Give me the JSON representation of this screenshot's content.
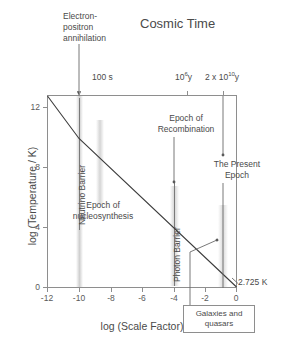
{
  "chart_data": {
    "type": "line",
    "title": "Cosmic Time",
    "xlabel": "log (Scale Factor)",
    "ylabel": "log (Temperature / K)",
    "xlim": [
      -13,
      1
    ],
    "ylim": [
      0,
      12.8
    ],
    "grid": false,
    "legend": "none",
    "x_ticks": [
      "-12",
      "-10",
      "-8",
      "-6",
      "-4",
      "-2",
      "0"
    ],
    "x_tick_values": [
      -12,
      -10,
      -8,
      -6,
      -4,
      -2,
      0
    ],
    "y_ticks": [
      "12",
      "8",
      "4",
      "0"
    ],
    "y_tick_values": [
      12,
      8,
      4,
      0
    ],
    "top_axis_label": "Cosmic Time",
    "top_ticks": [
      {
        "label": "100 s",
        "x": -10.2,
        "sup": ""
      },
      {
        "label": "10",
        "sup": "6",
        "suffix": " y",
        "x": -3.1
      },
      {
        "label": "2 x 10",
        "sup": "10",
        "suffix": " y",
        "x": -0.7
      }
    ],
    "series": [
      {
        "name": "Temperature of the Universe",
        "x": [
          -12.8,
          -10.2,
          0.2
        ],
        "values": [
          12.6,
          9.9,
          0.435
        ],
        "note": "Radiation-dominated then matter-dominated cooling curve; terminates at 2.725 K"
      }
    ],
    "annotations": [
      {
        "name": "electron-positron-annihilation",
        "text": "Electron-positron annihilation",
        "x": -10.2,
        "arrow": "down"
      },
      {
        "name": "neutrino-barrier",
        "text": "Neutrino Barrier",
        "x": -10.1,
        "orientation": "vertical"
      },
      {
        "name": "epoch-of-nucleosynthesis",
        "text": "Epoch of nucleosynthesis",
        "x": -8.8,
        "y": 5.5
      },
      {
        "name": "epoch-of-recombination",
        "text": "Epoch of Recombination",
        "x": -3.1,
        "y": 10.6,
        "arrow": "down"
      },
      {
        "name": "photon-barrier",
        "text": "Photon Barrier",
        "x": -3.3,
        "orientation": "vertical"
      },
      {
        "name": "the-present-epoch",
        "text": "The Present Epoch",
        "x": -0.7,
        "y": 8.0,
        "arrow": "down"
      },
      {
        "name": "galaxies-and-quasars",
        "text": "Galaxies and quasars",
        "x": -1.4,
        "arrow": "up-right"
      },
      {
        "name": "present-temperature",
        "text": "2.725 K",
        "x": 0.2,
        "y": 0.435
      }
    ]
  },
  "title": {
    "text": "Cosmic Time"
  },
  "axes": {
    "x_title": "log (Scale Factor)",
    "y_title": "log (Temperature / K)",
    "x_tick_labels": [
      "-12",
      "-10",
      "-8",
      "-6",
      "-4",
      "-2",
      "0"
    ],
    "y_tick_labels": [
      "12",
      "8",
      "4",
      "0"
    ]
  },
  "top_axis": {
    "tick_100s": "100 s",
    "tick_10e6_base": "10",
    "tick_10e6_exp": "6",
    "tick_10e6_unit": "y",
    "tick_2e10_base": "2 x 10",
    "tick_2e10_exp": "10",
    "tick_2e10_unit": "y"
  },
  "labels": {
    "electron_positron": "Electron-\npositron\nannihilation",
    "neutrino_barrier": "Neutrino Barrier",
    "photon_barrier": "Photon Barrier",
    "nucleosynthesis": "Epoch of\nnucleosynthesis",
    "recombination": "Epoch of\nRecombination",
    "present_epoch": "The  Present\nEpoch",
    "temperature_value": "2.725 K",
    "galaxies_box": "Galaxies and\nquasars"
  },
  "colors": {
    "axis": "#8e8e8e",
    "text": "#4a4a4a",
    "curve": "#3c3c3c",
    "band": "#969696"
  }
}
